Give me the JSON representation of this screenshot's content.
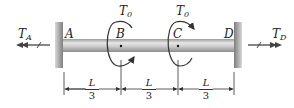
{
  "diagram": {
    "points": [
      {
        "id": "A",
        "label": "A"
      },
      {
        "id": "B",
        "label": "B"
      },
      {
        "id": "C",
        "label": "C"
      },
      {
        "id": "D",
        "label": "D"
      }
    ],
    "torques": [
      {
        "id": "T0_B",
        "symbol": "T",
        "subscript": "0",
        "at": "B"
      },
      {
        "id": "T0_C",
        "symbol": "T",
        "subscript": "0",
        "at": "C"
      }
    ],
    "reactions": [
      {
        "id": "TA",
        "symbol": "T",
        "subscript": "A",
        "direction": "left"
      },
      {
        "id": "TD",
        "symbol": "T",
        "subscript": "D",
        "direction": "right"
      }
    ],
    "dimensions": [
      {
        "segment": "AB",
        "numerator": "L",
        "denominator": "3"
      },
      {
        "segment": "BC",
        "numerator": "L",
        "denominator": "3"
      },
      {
        "segment": "CD",
        "numerator": "L",
        "denominator": "3"
      }
    ],
    "colors": {
      "shaft": "#c8c8c8",
      "wall": "#9a9a9a",
      "arrow": "#3a3a3a",
      "line": "#333333"
    }
  }
}
